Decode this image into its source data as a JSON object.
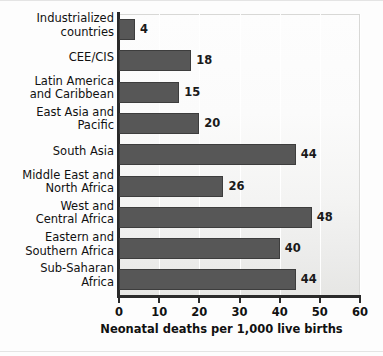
{
  "chart_data": {
    "type": "bar",
    "orientation": "horizontal",
    "title": "",
    "xlabel": "Neonatal deaths per 1,000 live births",
    "ylabel": "",
    "xlim": [
      0,
      60
    ],
    "xticks": [
      0,
      10,
      20,
      30,
      40,
      50,
      60
    ],
    "xtick_labels": [
      "0",
      "10",
      "20",
      "30",
      "40",
      "50",
      "60"
    ],
    "grid": true,
    "legend": null,
    "categories": [
      "Industrialized\ncountries",
      "CEE/CIS",
      "Latin America\nand Caribbean",
      "East Asia and\nPacific",
      "South Asia",
      "Middle East and\nNorth Africa",
      "West and\nCentral Africa",
      "Eastern and\nSouthern Africa",
      "Sub-Saharan\nAfrica"
    ],
    "values": [
      4,
      18,
      15,
      20,
      44,
      26,
      48,
      40,
      44
    ],
    "value_labels": [
      "4",
      "18",
      "15",
      "20",
      "44",
      "26",
      "48",
      "40",
      "44"
    ],
    "colors": {
      "bar_fill": "#575757",
      "bar_border": "#3d3d3d",
      "axis": "#2a2a2a",
      "text": "#111111",
      "plot_background": "#fbfbfb",
      "gridline": "#ffffff"
    }
  }
}
